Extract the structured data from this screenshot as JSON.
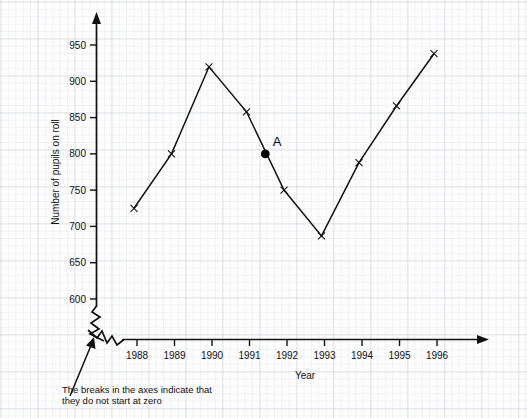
{
  "chart_data": {
    "type": "line",
    "title": "",
    "xlabel": "Year",
    "ylabel": "Number of pupils on roll",
    "categories": [
      1988,
      1989,
      1990,
      1991,
      1992,
      1993,
      1994,
      1995,
      1996
    ],
    "x_tick_labels": [
      "1988",
      "1989",
      "1990",
      "1991",
      "1992",
      "1993",
      "1994",
      "1995",
      "1996"
    ],
    "values": [
      725,
      800,
      920,
      858,
      750,
      687,
      788,
      866,
      938
    ],
    "y_tick_labels": [
      "600",
      "650",
      "700",
      "750",
      "800",
      "850",
      "900",
      "950"
    ],
    "y_ticks": [
      600,
      650,
      700,
      750,
      800,
      850,
      900,
      950
    ],
    "ylim": [
      585,
      965
    ],
    "xlim": [
      1987.3,
      1996.9
    ],
    "grid": true,
    "grid_style": "faint graph paper squares",
    "legend": "none",
    "axes_broken": true,
    "marker_style": "x",
    "line_color": "#111111",
    "annotations": [
      {
        "name": "point-A",
        "label": "A",
        "x": 1991.5,
        "y": 800,
        "marker": "filled-circle",
        "description": "marked point on the line segment between 1991 and 1992"
      }
    ]
  },
  "labels": {
    "y_axis_title": "Number of pupils on roll",
    "x_axis_title": "Year",
    "point_a": "A"
  },
  "note": {
    "line1": "The breaks in the axes indicate that",
    "line2": "they do not start at zero"
  },
  "watermark": {
    "text": ""
  },
  "colors": {
    "ink": "#111111",
    "background": "#fdfdfd",
    "grid_minor": "rgba(120,130,170,0.085)",
    "grid_major": "rgba(120,130,170,0.16)"
  }
}
